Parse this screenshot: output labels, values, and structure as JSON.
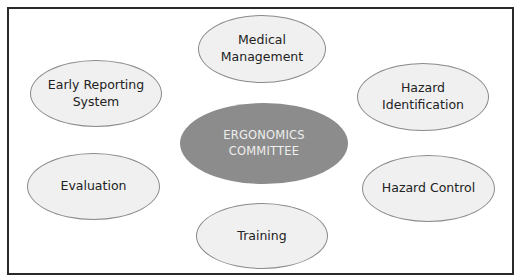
{
  "diagram": {
    "center": {
      "label": "ERGONOMICS\nCOMMITTEE",
      "color": "#8c8c8c",
      "text_color": "#eeeeee"
    },
    "nodes": [
      {
        "id": "medical-management",
        "label": "Medical Management"
      },
      {
        "id": "early-reporting-system",
        "label": "Early Reporting\nSystem"
      },
      {
        "id": "hazard-identification",
        "label": "Hazard Identification"
      },
      {
        "id": "evaluation",
        "label": "Evaluation"
      },
      {
        "id": "hazard-control",
        "label": "Hazard Control"
      },
      {
        "id": "training",
        "label": "Training"
      }
    ],
    "node_fill": "#f0f0f0",
    "node_border": "#8a8a8a",
    "frame_border": "#2a2a2a"
  }
}
